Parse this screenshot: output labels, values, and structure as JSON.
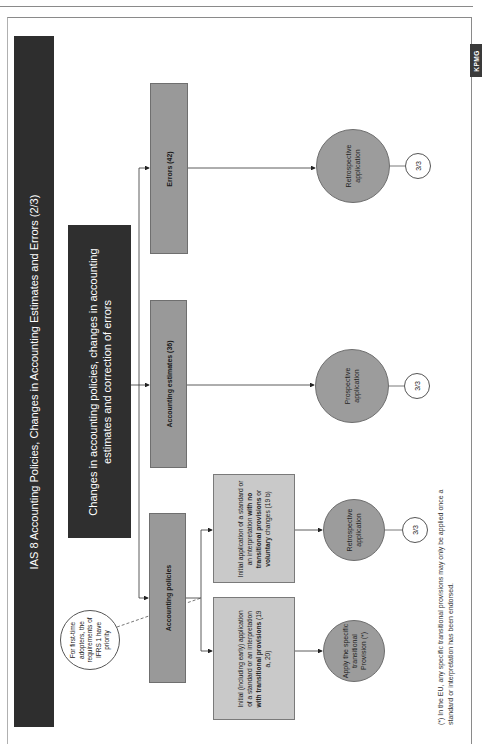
{
  "page": {
    "title": "IAS 8 Accounting Policies, Changes in Accounting Estimates and Errors (2/3)",
    "logo": "KPMG",
    "orientation": "rotated-90-ccw"
  },
  "diagram": {
    "root": "Changes in accounting policies, changes in accounting estimates and correction of errors",
    "categories": [
      {
        "id": "policies",
        "label": "Accounting policies"
      },
      {
        "id": "estimates",
        "label": "Accounting estimates (36)"
      },
      {
        "id": "errors",
        "label": "Errors (42)"
      }
    ],
    "policy_branches": [
      {
        "label_parts": [
          "Initial (including early) application of a standard or an interpretation ",
          "with transitional provisions",
          " (19 a, 20)"
        ],
        "outcome": "Apply the specific transitional Provision (*)"
      },
      {
        "label_parts": [
          "Initial application of a standard or an interpretation ",
          "with no transitional provisions",
          " or ",
          "voluntary",
          " changes (19 b)"
        ],
        "outcome": "Retrospective application",
        "next": "3/3"
      }
    ],
    "estimates_outcome": {
      "label": "Prospective application",
      "next": "3/3"
    },
    "errors_outcome": {
      "label": "Retrospective application",
      "next": "3/3"
    },
    "note": "For first-time adopters, the requirements of IFRS 1 have priority",
    "footnote": "(*) In the EU, any specific transitional provisions may only be applied once a standard or interpretation has been endorsed."
  },
  "colors": {
    "dark": "#2e2e2e",
    "category_gray": "#999999",
    "sub_gray": "#c9c9c9",
    "circle_gray": "#9c9c9c"
  }
}
